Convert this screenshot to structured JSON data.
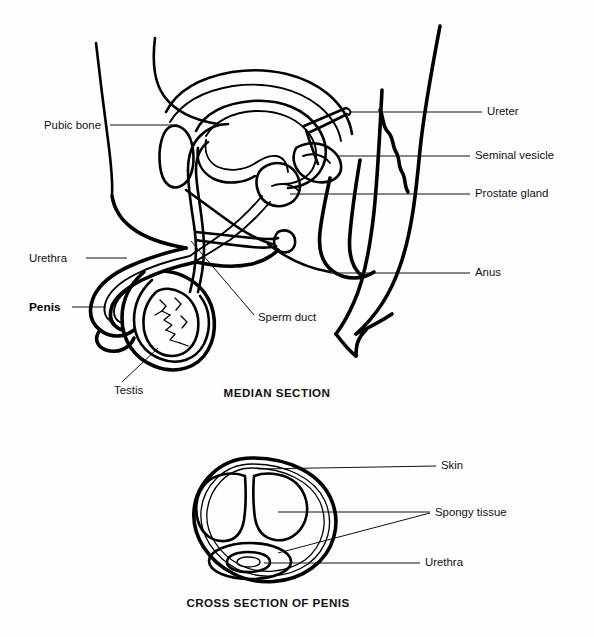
{
  "figure": {
    "background_color": "#fefefe",
    "ink_color": "#000000"
  },
  "median_section": {
    "caption": "MEDIAN SECTION",
    "labels": {
      "pubic_bone": "Pubic bone",
      "urethra": "Urethra",
      "penis": "Penis",
      "testis": "Testis",
      "sperm_duct": "Sperm duct",
      "ureter": "Ureter",
      "seminal_vesicle": "Seminal vesicle",
      "prostate_gland": "Prostate gland",
      "anus": "Anus"
    }
  },
  "cross_section": {
    "caption": "CROSS SECTION OF PENIS",
    "labels": {
      "skin": "Skin",
      "spongy_tissue": "Spongy tissue",
      "urethra": "Urethra"
    }
  }
}
